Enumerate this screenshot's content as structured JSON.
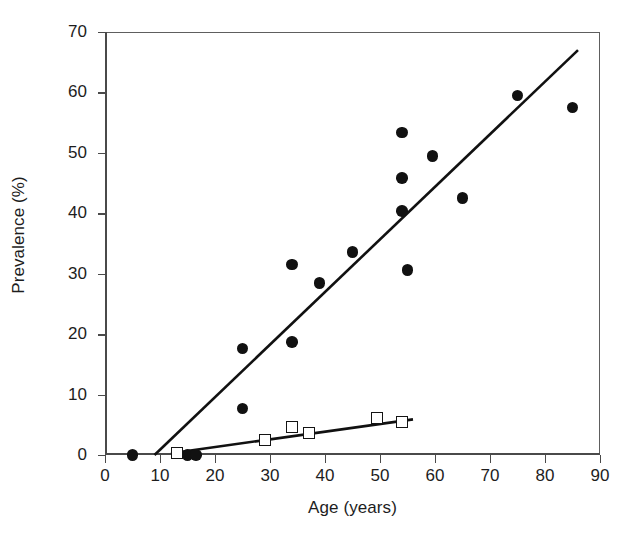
{
  "chart_data": {
    "type": "scatter",
    "title": "",
    "xlabel": "Age (years)",
    "ylabel": "Prevalence (%)",
    "xlim": [
      0,
      90
    ],
    "ylim": [
      0,
      70
    ],
    "xticks": [
      0,
      10,
      20,
      30,
      40,
      50,
      60,
      70,
      80,
      90
    ],
    "yticks": [
      0,
      10,
      20,
      30,
      40,
      50,
      60,
      70
    ],
    "grid": false,
    "legend": null,
    "series": [
      {
        "name": "filled-circles",
        "marker": "filled-circle",
        "color": "#111111",
        "points": [
          {
            "x": 5,
            "y": 0.0
          },
          {
            "x": 15,
            "y": 0.0
          },
          {
            "x": 16.5,
            "y": 0.0
          },
          {
            "x": 25,
            "y": 17.6
          },
          {
            "x": 25,
            "y": 7.7
          },
          {
            "x": 34,
            "y": 31.5
          },
          {
            "x": 34,
            "y": 18.7
          },
          {
            "x": 39,
            "y": 28.5
          },
          {
            "x": 45,
            "y": 33.6
          },
          {
            "x": 54,
            "y": 53.4
          },
          {
            "x": 54,
            "y": 45.8
          },
          {
            "x": 54,
            "y": 40.4
          },
          {
            "x": 55,
            "y": 30.6
          },
          {
            "x": 59.5,
            "y": 49.5
          },
          {
            "x": 65,
            "y": 42.5
          },
          {
            "x": 75,
            "y": 59.5
          },
          {
            "x": 85,
            "y": 57.5
          }
        ]
      },
      {
        "name": "open-squares",
        "marker": "open-square",
        "color": "#141414",
        "points": [
          {
            "x": 13,
            "y": 0.3
          },
          {
            "x": 29,
            "y": 2.4
          },
          {
            "x": 34,
            "y": 4.6
          },
          {
            "x": 37,
            "y": 3.7
          },
          {
            "x": 49.5,
            "y": 6.2
          },
          {
            "x": 54,
            "y": 5.5
          }
        ]
      }
    ],
    "fit_lines": [
      {
        "name": "steep-regression-line",
        "for_series": "filled-circles",
        "x_start": 9.0,
        "y_start": 0.0,
        "x_end": 86.0,
        "y_end": 67.0,
        "color": "#111111"
      },
      {
        "name": "shallow-regression-line",
        "for_series": "open-squares",
        "x_start": 12.0,
        "y_start": 0.3,
        "x_end": 56.0,
        "y_end": 5.9,
        "color": "#111111"
      }
    ]
  },
  "caption": {
    "text": ""
  }
}
